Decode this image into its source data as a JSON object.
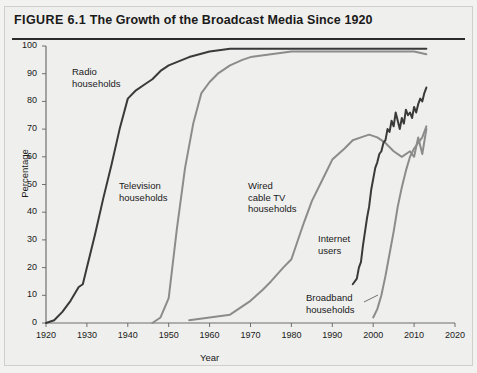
{
  "figure": {
    "number": "FIGURE 6.1",
    "title": "The Growth of the Broadcast Media Since 1920"
  },
  "chart_data": {
    "type": "line",
    "title": "FIGURE 6.1 The Growth of the Broadcast Media Since 1920",
    "xlabel": "Year",
    "ylabel": "Percentage",
    "xlim": [
      1920,
      2020
    ],
    "ylim": [
      0,
      100
    ],
    "xticks": [
      1920,
      1930,
      1940,
      1950,
      1960,
      1970,
      1980,
      1990,
      2000,
      2010,
      2020
    ],
    "yticks": [
      0,
      10,
      20,
      30,
      40,
      50,
      60,
      70,
      80,
      90,
      100
    ],
    "grid": false,
    "legend": "inline-annotations",
    "colors": {
      "dark": "#3a3a3a",
      "gray": "#8c8c8c",
      "axis": "#6f6f6f",
      "text": "#1a1a1a"
    },
    "series": [
      {
        "name": "Radio households",
        "color": "#3a3a3a",
        "label_position": "upper-left",
        "points": [
          [
            1920,
            0
          ],
          [
            1922,
            1
          ],
          [
            1924,
            4
          ],
          [
            1926,
            8
          ],
          [
            1928,
            13
          ],
          [
            1929,
            14
          ],
          [
            1930,
            20
          ],
          [
            1932,
            32
          ],
          [
            1934,
            45
          ],
          [
            1936,
            57
          ],
          [
            1938,
            70
          ],
          [
            1940,
            81
          ],
          [
            1942,
            84
          ],
          [
            1944,
            86
          ],
          [
            1946,
            88
          ],
          [
            1948,
            91
          ],
          [
            1950,
            93
          ],
          [
            1955,
            96
          ],
          [
            1960,
            98
          ],
          [
            1965,
            99
          ],
          [
            1970,
            99
          ],
          [
            1980,
            99
          ],
          [
            1990,
            99
          ],
          [
            2000,
            99
          ],
          [
            2010,
            99
          ],
          [
            2013,
            99
          ]
        ]
      },
      {
        "name": "Television households",
        "color": "#8c8c8c",
        "label_position": "middle-left",
        "points": [
          [
            1946,
            0
          ],
          [
            1948,
            2
          ],
          [
            1950,
            9
          ],
          [
            1952,
            34
          ],
          [
            1954,
            56
          ],
          [
            1956,
            72
          ],
          [
            1958,
            83
          ],
          [
            1960,
            87
          ],
          [
            1962,
            90
          ],
          [
            1965,
            93
          ],
          [
            1968,
            95
          ],
          [
            1970,
            96
          ],
          [
            1975,
            97
          ],
          [
            1980,
            98
          ],
          [
            1990,
            98
          ],
          [
            2000,
            98
          ],
          [
            2010,
            98
          ],
          [
            2013,
            97
          ]
        ]
      },
      {
        "name": "Wired cable TV households",
        "color": "#8c8c8c",
        "label_position": "middle-center",
        "points": [
          [
            1955,
            1
          ],
          [
            1960,
            2
          ],
          [
            1965,
            3
          ],
          [
            1968,
            6
          ],
          [
            1970,
            8
          ],
          [
            1973,
            12
          ],
          [
            1975,
            15
          ],
          [
            1978,
            20
          ],
          [
            1980,
            23
          ],
          [
            1983,
            36
          ],
          [
            1985,
            44
          ],
          [
            1988,
            53
          ],
          [
            1990,
            59
          ],
          [
            1993,
            63
          ],
          [
            1995,
            66
          ],
          [
            1997,
            67
          ],
          [
            1999,
            68
          ],
          [
            2001,
            67
          ],
          [
            2003,
            65
          ],
          [
            2005,
            62
          ],
          [
            2007,
            60
          ],
          [
            2009,
            62
          ],
          [
            2010,
            60
          ],
          [
            2011,
            67
          ],
          [
            2012,
            61
          ],
          [
            2013,
            70
          ]
        ]
      },
      {
        "name": "Internet users",
        "color": "#3a3a3a",
        "label_position": "lower-center",
        "points": [
          [
            1995,
            14
          ],
          [
            1996,
            16
          ],
          [
            1996.5,
            20
          ],
          [
            1997,
            22
          ],
          [
            1997.5,
            28
          ],
          [
            1998,
            33
          ],
          [
            1998.5,
            38
          ],
          [
            1999,
            42
          ],
          [
            1999.5,
            48
          ],
          [
            2000,
            52
          ],
          [
            2000.5,
            56
          ],
          [
            2001,
            58
          ],
          [
            2001.5,
            61
          ],
          [
            2002,
            62
          ],
          [
            2002.5,
            65
          ],
          [
            2003,
            66
          ],
          [
            2003.5,
            70
          ],
          [
            2004,
            69
          ],
          [
            2004.5,
            73
          ],
          [
            2005,
            71
          ],
          [
            2005.5,
            76
          ],
          [
            2006,
            73
          ],
          [
            2006.5,
            70
          ],
          [
            2007,
            74
          ],
          [
            2007.5,
            72
          ],
          [
            2008,
            77
          ],
          [
            2008.5,
            75
          ],
          [
            2009,
            76
          ],
          [
            2009.5,
            74
          ],
          [
            2010,
            78
          ],
          [
            2010.5,
            76
          ],
          [
            2011,
            79
          ],
          [
            2011.5,
            81
          ],
          [
            2012,
            80
          ],
          [
            2012.5,
            83
          ],
          [
            2013,
            85
          ]
        ]
      },
      {
        "name": "Broadband households",
        "color": "#8c8c8c",
        "label_position": "bottom-center",
        "points": [
          [
            2000,
            2
          ],
          [
            2001,
            5
          ],
          [
            2002,
            10
          ],
          [
            2003,
            17
          ],
          [
            2004,
            25
          ],
          [
            2005,
            33
          ],
          [
            2006,
            42
          ],
          [
            2007,
            49
          ],
          [
            2008,
            55
          ],
          [
            2009,
            60
          ],
          [
            2010,
            63
          ],
          [
            2011,
            65
          ],
          [
            2012,
            67
          ],
          [
            2013,
            71
          ]
        ]
      }
    ],
    "annotations": [
      {
        "text": "Radio\nhouseholds",
        "x_px": 72,
        "y_px": 66
      },
      {
        "text": "Television\nhouseholds",
        "x_px": 119,
        "y_px": 180
      },
      {
        "text": "Wired\ncable TV\nhouseholds",
        "x_px": 248,
        "y_px": 180
      },
      {
        "text": "Internet\nusers",
        "x_px": 318,
        "y_px": 233
      },
      {
        "text": "Broadband\nhouseholds",
        "x_px": 306,
        "y_px": 292
      }
    ]
  }
}
